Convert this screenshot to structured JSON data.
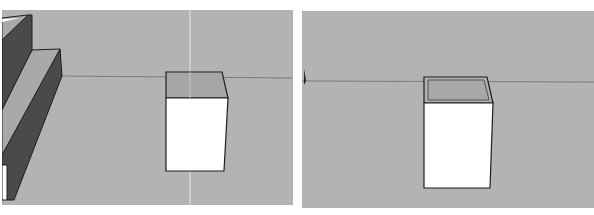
{
  "captions": {
    "left": "",
    "right": ""
  },
  "viewports": [
    {
      "id": "left",
      "description": "3D modeling viewport showing stepped block on left and a box with top face shaded",
      "colors": {
        "background": "#b3b3b3",
        "ground": "#b6b6b6",
        "sky": "#b2b2b2",
        "horizon": "#7a7a7a",
        "face_white": "#ffffff",
        "face_top": "#a9a9a9",
        "face_dark": "#4a4a4a",
        "edge": "#1e1e1e",
        "guide": "#e8e8e8"
      }
    },
    {
      "id": "right",
      "description": "3D modeling viewport showing box with inset (offset) top face",
      "colors": {
        "background": "#b3b3b3",
        "horizon": "#7a7a7a",
        "face_white": "#ffffff",
        "face_top": "#a9a9a9",
        "edge": "#1e1e1e"
      }
    }
  ]
}
